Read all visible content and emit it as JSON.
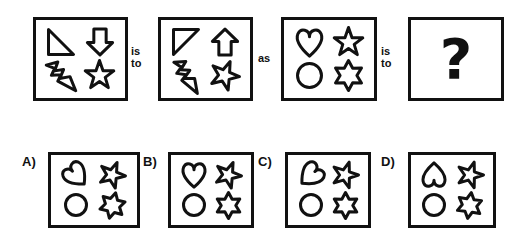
{
  "puzzle": {
    "type": "visual-analogy-multiple-choice",
    "background_color": "#ffffff",
    "ink_color": "#111111",
    "connectors": [
      {
        "id": "conn1",
        "text": "is\nto",
        "x": 131,
        "y": 45
      },
      {
        "id": "conn2",
        "text": "as",
        "x": 258,
        "y": 52
      },
      {
        "id": "conn3",
        "text": "is\nto",
        "x": 381,
        "y": 45
      }
    ],
    "prompt_panels": [
      {
        "id": "panel-a1",
        "name": "analogy-term-1",
        "x": 33,
        "y": 17,
        "w": 95,
        "h": 84,
        "shapes": [
          {
            "slot": "top-left",
            "kind": "triangle",
            "variant": "right-angle-bottom-left",
            "rotate": 0
          },
          {
            "slot": "top-right",
            "kind": "arrow",
            "variant": "down",
            "rotate": 0
          },
          {
            "slot": "bottom-left",
            "kind": "bolt",
            "variant": "down-right",
            "rotate": 0
          },
          {
            "slot": "bottom-right",
            "kind": "star5",
            "variant": "upright",
            "rotate": 0
          }
        ]
      },
      {
        "id": "panel-a2",
        "name": "analogy-term-2",
        "x": 158,
        "y": 17,
        "w": 95,
        "h": 84,
        "shapes": [
          {
            "slot": "top-left",
            "kind": "triangle",
            "variant": "right-angle-top-right",
            "rotate": 0
          },
          {
            "slot": "top-right",
            "kind": "arrow",
            "variant": "up",
            "rotate": 0
          },
          {
            "slot": "bottom-left",
            "kind": "bolt",
            "variant": "down-right",
            "rotate": 12
          },
          {
            "slot": "bottom-right",
            "kind": "star5",
            "variant": "tilted",
            "rotate": 22
          }
        ]
      },
      {
        "id": "panel-b1",
        "name": "analogy-term-3",
        "x": 281,
        "y": 17,
        "w": 96,
        "h": 84,
        "shapes": [
          {
            "slot": "top-left",
            "kind": "heart",
            "variant": "upright",
            "rotate": 0
          },
          {
            "slot": "top-right",
            "kind": "star5",
            "variant": "upright",
            "rotate": 0
          },
          {
            "slot": "bottom-left",
            "kind": "circle",
            "variant": "plain",
            "rotate": 0
          },
          {
            "slot": "bottom-right",
            "kind": "star6",
            "variant": "upright",
            "rotate": 0
          }
        ]
      },
      {
        "id": "panel-b2",
        "name": "analogy-answer-unknown",
        "x": 408,
        "y": 17,
        "w": 96,
        "h": 84,
        "question_mark": "?",
        "shapes": []
      }
    ],
    "options": [
      {
        "id": "option-a",
        "label": "A)",
        "label_x": 22,
        "label_y": 155,
        "x": 48,
        "y": 152,
        "w": 92,
        "h": 76,
        "shapes": [
          {
            "slot": "top-left",
            "kind": "heart",
            "variant": "rotated-left",
            "rotate": -42
          },
          {
            "slot": "top-right",
            "kind": "star5",
            "variant": "tilted",
            "rotate": 22
          },
          {
            "slot": "bottom-left",
            "kind": "circle",
            "variant": "plain",
            "rotate": 0
          },
          {
            "slot": "bottom-right",
            "kind": "star6",
            "variant": "tilted",
            "rotate": 14
          }
        ]
      },
      {
        "id": "option-b",
        "label": "B)",
        "label_x": 143,
        "label_y": 155,
        "x": 168,
        "y": 152,
        "w": 86,
        "h": 76,
        "shapes": [
          {
            "slot": "top-left",
            "kind": "heart",
            "variant": "upright",
            "rotate": 0
          },
          {
            "slot": "top-right",
            "kind": "star5",
            "variant": "tilted",
            "rotate": 22
          },
          {
            "slot": "bottom-left",
            "kind": "circle",
            "variant": "plain",
            "rotate": 0
          },
          {
            "slot": "bottom-right",
            "kind": "star6",
            "variant": "upright",
            "rotate": 0
          }
        ]
      },
      {
        "id": "option-c",
        "label": "C)",
        "label_x": 258,
        "label_y": 155,
        "x": 285,
        "y": 152,
        "w": 86,
        "h": 76,
        "shapes": [
          {
            "slot": "top-left",
            "kind": "heart",
            "variant": "rotated-right",
            "rotate": 48
          },
          {
            "slot": "top-right",
            "kind": "star5",
            "variant": "tilted",
            "rotate": 18
          },
          {
            "slot": "bottom-left",
            "kind": "circle",
            "variant": "plain",
            "rotate": 0
          },
          {
            "slot": "bottom-right",
            "kind": "star6",
            "variant": "upright",
            "rotate": 0
          }
        ]
      },
      {
        "id": "option-d",
        "label": "D)",
        "label_x": 381,
        "label_y": 155,
        "x": 408,
        "y": 152,
        "w": 88,
        "h": 76,
        "shapes": [
          {
            "slot": "top-left",
            "kind": "heart",
            "variant": "inverted",
            "rotate": 180
          },
          {
            "slot": "top-right",
            "kind": "star5",
            "variant": "tilted",
            "rotate": 18
          },
          {
            "slot": "bottom-left",
            "kind": "circle",
            "variant": "plain",
            "rotate": 0
          },
          {
            "slot": "bottom-right",
            "kind": "star6",
            "variant": "tilted",
            "rotate": 8
          }
        ]
      }
    ]
  }
}
